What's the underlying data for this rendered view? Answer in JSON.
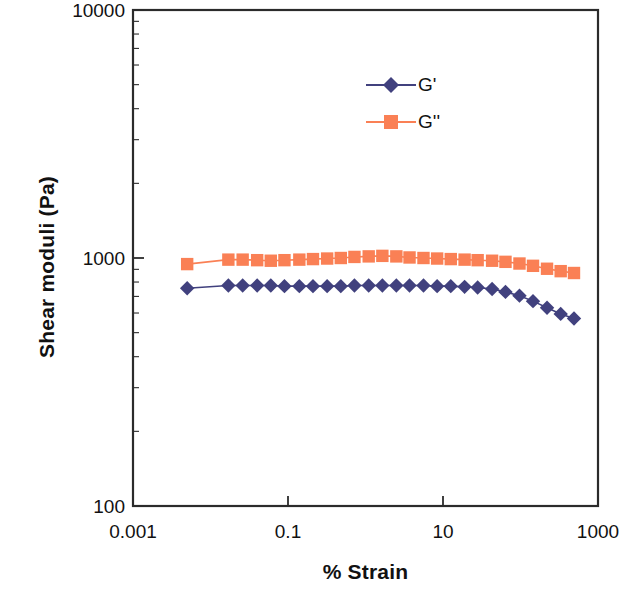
{
  "chart_data": {
    "type": "line",
    "title": "",
    "xlabel": "% Strain",
    "ylabel": "Shear moduli (Pa)",
    "xscale": "log",
    "yscale": "log",
    "xlim": [
      0.001,
      1000
    ],
    "ylim": [
      100,
      10000
    ],
    "xticks": [
      0.001,
      0.1,
      10,
      1000
    ],
    "xtick_labels": [
      "0.001",
      "0.1",
      "10",
      "1000"
    ],
    "yticks": [
      100,
      1000,
      10000
    ],
    "ytick_labels": [
      "100",
      "1000",
      "10000"
    ],
    "grid": false,
    "minor_ticks": true,
    "legend_position": "upper-center-right",
    "series": [
      {
        "name": "G'",
        "label": "G'",
        "color": "#41417e",
        "marker": "diamond",
        "x": [
          0.005,
          0.017,
          0.026,
          0.04,
          0.06,
          0.09,
          0.14,
          0.21,
          0.32,
          0.48,
          0.72,
          1.1,
          1.65,
          2.5,
          3.7,
          5.6,
          8.4,
          12.6,
          19,
          28,
          43,
          64,
          97,
          145,
          220,
          330,
          490
        ],
        "y": [
          755,
          775,
          775,
          775,
          775,
          770,
          770,
          770,
          770,
          770,
          775,
          775,
          775,
          775,
          775,
          775,
          770,
          770,
          765,
          760,
          750,
          730,
          705,
          670,
          630,
          595,
          570
        ]
      },
      {
        "name": "G''",
        "label": "G''",
        "color": "#fa8055",
        "marker": "square",
        "x": [
          0.005,
          0.017,
          0.026,
          0.04,
          0.06,
          0.09,
          0.14,
          0.21,
          0.32,
          0.48,
          0.72,
          1.1,
          1.65,
          2.5,
          3.7,
          5.6,
          8.4,
          12.6,
          19,
          28,
          43,
          64,
          97,
          145,
          220,
          330,
          490
        ],
        "y": [
          945,
          985,
          985,
          980,
          975,
          980,
          985,
          990,
          995,
          1000,
          1010,
          1015,
          1020,
          1015,
          1005,
          1000,
          995,
          990,
          985,
          980,
          975,
          965,
          950,
          930,
          905,
          885,
          870
        ]
      }
    ]
  },
  "legend": {
    "entries": [
      {
        "label": "G'",
        "color": "#41417e",
        "marker": "diamond"
      },
      {
        "label": "G''",
        "color": "#fa8055",
        "marker": "square"
      }
    ]
  },
  "axes": {
    "y_title": "Shear moduli (Pa)",
    "x_title": "% Strain",
    "y_tick_top": "10000",
    "y_tick_mid": "1000",
    "y_tick_bottom": "100",
    "x_tick_1": "0.001",
    "x_tick_2": "0.1",
    "x_tick_3": "10",
    "x_tick_4": "1000"
  },
  "colors": {
    "series_g_prime": "#41417e",
    "series_g_double_prime": "#fa8055",
    "frame": "#2b2b2b",
    "background": "#ffffff"
  }
}
